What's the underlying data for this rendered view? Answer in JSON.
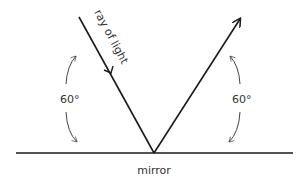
{
  "diagram": {
    "labels": {
      "ray": "ray of light",
      "mirror": "mirror",
      "angle_incidence": "60°",
      "angle_reflection": "60°"
    },
    "colors": {
      "line": "#1a1a1a",
      "text": "#333333",
      "background": "#ffffff"
    }
  }
}
